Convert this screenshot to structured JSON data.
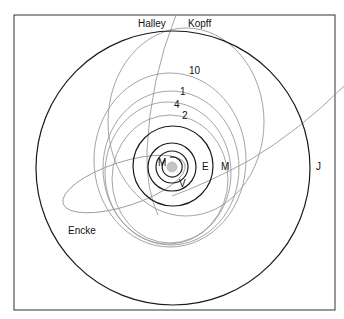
{
  "diagram": {
    "type": "orbit-diagram",
    "frame": {
      "x": 14,
      "y": 15,
      "width": 321,
      "height": 295
    },
    "sun": {
      "cx": 172,
      "cy": 167,
      "r": 5,
      "color": "#c4c4c4"
    },
    "planets": [
      {
        "name": "Mercury",
        "label": "M",
        "r": 10
      },
      {
        "name": "Venus",
        "label": "V",
        "r": 16
      },
      {
        "name": "Earth",
        "label": "E",
        "r": 24
      },
      {
        "name": "Mars",
        "label": "M",
        "r": 40
      },
      {
        "name": "Jupiter",
        "label": "J",
        "r": 138
      }
    ],
    "comets": [
      {
        "name": "Halley",
        "label": "Halley"
      },
      {
        "name": "Kopff",
        "label": "Kopff"
      },
      {
        "name": "Comet 10",
        "label": "10"
      },
      {
        "name": "Comet 1",
        "label": "1"
      },
      {
        "name": "Comet 4",
        "label": "4"
      },
      {
        "name": "Comet 2",
        "label": "2"
      },
      {
        "name": "Encke",
        "label": "Encke"
      }
    ],
    "colors": {
      "planet_orbit": "#1a1a1a",
      "comet_orbit": "#9a9a9a",
      "frame": "#333333"
    }
  }
}
